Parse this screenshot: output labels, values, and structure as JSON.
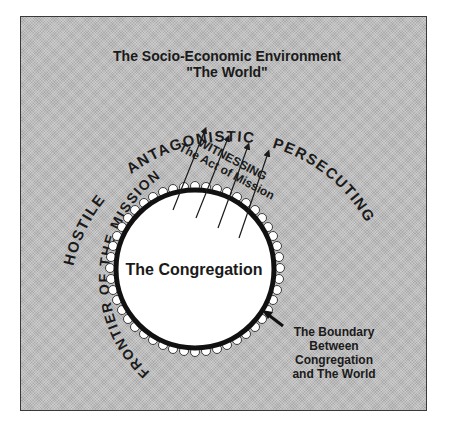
{
  "title": {
    "line1": "The Socio-Economic Environment",
    "line2": "\"The World\""
  },
  "arc_labels": {
    "hostile": "HOSTILE",
    "antagonistic": "ANTAGONISTIC",
    "persecuting": "PERSECUTING",
    "frontier": "FRONTIER OF THE MISSION"
  },
  "witnessing": {
    "line1": "WITNESSING",
    "line2": "The Act of Mission"
  },
  "center": {
    "label": "The Congregation"
  },
  "boundary": {
    "line1": "The Boundary",
    "line2": "Between",
    "line3": "Congregation",
    "line4": "and The World"
  },
  "colors": {
    "background": "#bdbdbd",
    "circle_fill": "#ffffff",
    "ink": "#1a1a1a"
  }
}
